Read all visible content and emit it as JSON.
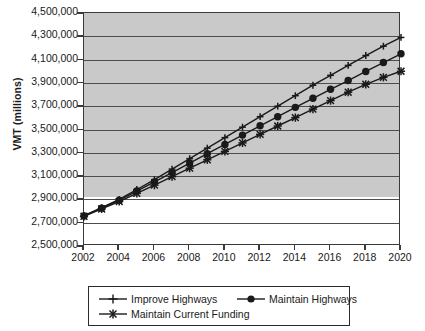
{
  "chart_data": {
    "type": "line",
    "title": "",
    "xlabel": "",
    "ylabel": "VMT (millions)",
    "xlim": [
      2002,
      2020
    ],
    "ylim": [
      2500000,
      4500000
    ],
    "grid": true,
    "legend_position": "bottom",
    "x": [
      2002,
      2003,
      2004,
      2005,
      2006,
      2007,
      2008,
      2009,
      2010,
      2011,
      2012,
      2013,
      2014,
      2015,
      2016,
      2017,
      2018,
      2019,
      2020
    ],
    "x_tick_labels": [
      "2002",
      "2004",
      "2006",
      "2008",
      "2010",
      "2012",
      "2014",
      "2016",
      "2018",
      "2020"
    ],
    "y_tick_labels": [
      "4,500,000",
      "4,300,000",
      "4,100,000",
      "3,900,000",
      "3,700,000",
      "3,500,000",
      "3,300,000",
      "3,100,000",
      "2,900,000",
      "2,700,000",
      "2,500,000"
    ],
    "y_tick_values": [
      4500000,
      4300000,
      4100000,
      3900000,
      3700000,
      3500000,
      3300000,
      3100000,
      2900000,
      2700000,
      2500000
    ],
    "series": [
      {
        "name": "Improve Highways",
        "marker": "plus",
        "values": [
          2760000,
          2830000,
          2900000,
          2985000,
          3070000,
          3160000,
          3250000,
          3340000,
          3430000,
          3520000,
          3610000,
          3700000,
          3790000,
          3880000,
          3965000,
          4050000,
          4135000,
          4215000,
          4290000
        ]
      },
      {
        "name": "Maintain Highways",
        "marker": "circle",
        "values": [
          2758000,
          2825000,
          2893000,
          2972000,
          3050000,
          3130000,
          3212000,
          3292000,
          3372000,
          3452000,
          3532000,
          3610000,
          3690000,
          3768000,
          3845000,
          3920000,
          3998000,
          4075000,
          4150000
        ]
      },
      {
        "name": "Maintain Current Funding",
        "marker": "star",
        "values": [
          2755000,
          2818000,
          2882000,
          2952000,
          3022000,
          3095000,
          3168000,
          3240000,
          3312000,
          3385000,
          3458000,
          3530000,
          3602000,
          3675000,
          3748000,
          3820000,
          3888000,
          3948000,
          4000000
        ]
      }
    ]
  },
  "colors": {
    "plot_background": "#c9c9c9",
    "lower_background": "#ffffff",
    "gridline": "#4d4d4d",
    "axis": "#3a3a3a",
    "series": "#1a1a1a",
    "text": "#1a1a1a"
  }
}
